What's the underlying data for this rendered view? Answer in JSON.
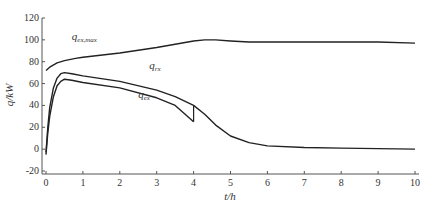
{
  "chart_data": {
    "type": "line",
    "title": "",
    "xlabel": "t/h",
    "ylabel": "q/kW",
    "xlim": [
      0,
      10
    ],
    "ylim": [
      -20,
      120
    ],
    "xticks": [
      0,
      1,
      2,
      3,
      4,
      5,
      6,
      7,
      8,
      9,
      10
    ],
    "yticks": [
      -20,
      0,
      20,
      40,
      60,
      80,
      100,
      120
    ],
    "grid": false,
    "series": [
      {
        "name": "q_ex,max",
        "label_main": "q",
        "label_sub": "ex,max",
        "x": [
          0,
          0.1,
          0.3,
          0.5,
          0.8,
          1,
          2,
          3,
          4,
          4.3,
          4.6,
          5,
          5.5,
          6,
          7,
          8,
          9,
          10
        ],
        "values": [
          72,
          75,
          79,
          81,
          83,
          84,
          88,
          93,
          99,
          100,
          100,
          99,
          98,
          98,
          98,
          98,
          98,
          97
        ]
      },
      {
        "name": "q_rx",
        "label_main": "q",
        "label_sub": "rx",
        "x": [
          0,
          0.05,
          0.1,
          0.2,
          0.3,
          0.4,
          0.5,
          0.7,
          1,
          2,
          3,
          3.5,
          4,
          4.3,
          4.6,
          5,
          5.5,
          6,
          7,
          8,
          9,
          10
        ],
        "values": [
          -3,
          20,
          38,
          56,
          65,
          69,
          70,
          69,
          67,
          62,
          54,
          48,
          40,
          32,
          22,
          12,
          6,
          3,
          1.5,
          1,
          0.5,
          0
        ]
      },
      {
        "name": "q_ex",
        "label_main": "q",
        "label_sub": "ex",
        "x": [
          0,
          0.05,
          0.1,
          0.2,
          0.3,
          0.4,
          0.5,
          0.7,
          1,
          2,
          3,
          3.5,
          4
        ],
        "values": [
          -5,
          15,
          30,
          48,
          58,
          62,
          64,
          63,
          61,
          56,
          47,
          40,
          25
        ]
      }
    ],
    "annotations": [
      {
        "text_main": "q",
        "text_sub": "ex,max",
        "x": 0.7,
        "y": 100
      },
      {
        "text_main": "q",
        "text_sub": "rx",
        "x": 2.8,
        "y": 73
      },
      {
        "text_main": "q",
        "text_sub": "ex",
        "x": 2.5,
        "y": 47
      }
    ]
  }
}
